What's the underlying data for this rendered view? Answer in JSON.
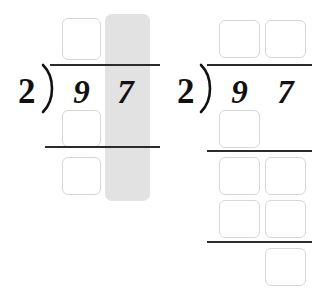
{
  "page": {
    "background_color": "#ffffff",
    "box_border_color": "#d6d6d6",
    "rule_color": "#2b2b2b",
    "highlight_color": "#e2e2e2",
    "digit_color": "#111111"
  },
  "problems": [
    {
      "id": "left-problem",
      "divisor": "2",
      "bracket": ")",
      "dividend_digits": [
        "9",
        "7"
      ],
      "highlight": {
        "name": "ones-column-highlight",
        "column": "ones",
        "color": "#e2e2e2"
      },
      "rules": [
        {
          "name": "vinculum",
          "label": ""
        },
        {
          "name": "subtraction-rule",
          "label": ""
        }
      ],
      "boxes": [
        {
          "name": "quotient-ones-box",
          "value": "",
          "row": "quotient",
          "column": "ones"
        },
        {
          "name": "partial-product-tens-box",
          "value": "",
          "row": "partial-product",
          "column": "tens"
        },
        {
          "name": "remainder-tens-box",
          "value": "",
          "row": "remainder",
          "column": "tens"
        }
      ]
    },
    {
      "id": "right-problem",
      "divisor": "2",
      "bracket": ")",
      "dividend_digits": [
        "9",
        "7"
      ],
      "rules": [
        {
          "name": "vinculum",
          "label": ""
        },
        {
          "name": "first-subtraction-rule",
          "label": ""
        },
        {
          "name": "second-subtraction-rule",
          "label": ""
        }
      ],
      "boxes": [
        {
          "name": "quotient-tens-box",
          "value": "",
          "row": "quotient",
          "column": "tens"
        },
        {
          "name": "quotient-ones-box",
          "value": "",
          "row": "quotient",
          "column": "ones"
        },
        {
          "name": "partial-product-tens-box",
          "value": "",
          "row": "partial-product",
          "column": "tens"
        },
        {
          "name": "bring-down-tens-box",
          "value": "",
          "row": "bring-down",
          "column": "tens"
        },
        {
          "name": "bring-down-ones-box",
          "value": "",
          "row": "bring-down",
          "column": "ones"
        },
        {
          "name": "second-partial-product-tens-box",
          "value": "",
          "row": "second-partial-product",
          "column": "tens"
        },
        {
          "name": "second-partial-product-ones-box",
          "value": "",
          "row": "second-partial-product",
          "column": "ones"
        },
        {
          "name": "remainder-ones-box",
          "value": "",
          "row": "remainder",
          "column": "ones"
        }
      ]
    }
  ]
}
